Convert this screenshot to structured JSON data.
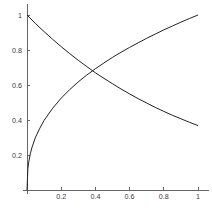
{
  "chart_data": {
    "type": "line",
    "title": "",
    "subtitle": "",
    "xlabel": "",
    "ylabel": "",
    "xlim": [
      0,
      1.05
    ],
    "ylim": [
      0,
      1.05
    ],
    "grid": false,
    "legend": "none",
    "background_color": "#ffffff",
    "axis_color": "#555555",
    "curve_color": "#222222",
    "x_ticks": [
      0.2,
      0.4,
      0.6,
      0.8,
      1
    ],
    "x_tick_labels": [
      "0.2",
      "0.4",
      "0.6",
      "0.8",
      "1"
    ],
    "y_ticks": [
      0.2,
      0.4,
      0.6,
      0.8,
      1
    ],
    "y_tick_labels": [
      "0.2",
      "0.4",
      "0.6",
      "0.8",
      "1"
    ],
    "annotations": [],
    "intersection": {
      "x": 0.435,
      "y": 0.64
    },
    "series": [
      {
        "name": "increasing-concave-curve",
        "color": "#222222",
        "x": [
          0,
          0.005,
          0.01,
          0.02,
          0.03,
          0.05,
          0.075,
          0.1,
          0.15,
          0.2,
          0.25,
          0.3,
          0.35,
          0.4,
          0.45,
          0.5,
          0.55,
          0.6,
          0.65,
          0.7,
          0.75,
          0.8,
          0.85,
          0.9,
          0.95,
          1
        ],
        "values": [
          0,
          0.121,
          0.159,
          0.21,
          0.246,
          0.302,
          0.353,
          0.398,
          0.467,
          0.525,
          0.574,
          0.618,
          0.657,
          0.693,
          0.726,
          0.758,
          0.787,
          0.815,
          0.841,
          0.867,
          0.891,
          0.915,
          0.937,
          0.959,
          0.98,
          1
        ]
      },
      {
        "name": "decreasing-convex-curve",
        "color": "#222222",
        "x": [
          0,
          0.05,
          0.1,
          0.15,
          0.2,
          0.25,
          0.3,
          0.35,
          0.4,
          0.45,
          0.5,
          0.55,
          0.6,
          0.65,
          0.7,
          0.75,
          0.8,
          0.85,
          0.9,
          0.95,
          1
        ],
        "values": [
          1,
          0.951,
          0.905,
          0.861,
          0.819,
          0.779,
          0.741,
          0.705,
          0.67,
          0.638,
          0.607,
          0.577,
          0.549,
          0.522,
          0.497,
          0.472,
          0.449,
          0.427,
          0.407,
          0.387,
          0.368
        ]
      }
    ]
  },
  "plot": {
    "geometry": {
      "origin_x": 27,
      "origin_y": 190,
      "unit_x": 171,
      "unit_y": 175,
      "tick_len": 3
    }
  }
}
